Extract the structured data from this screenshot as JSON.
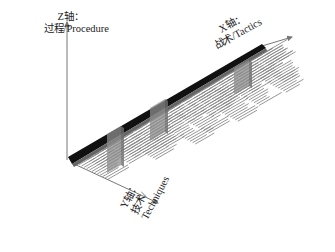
{
  "diagram": {
    "title": "",
    "axes": {
      "z": {
        "line1": "Z轴：",
        "line2": "过程/Procedure"
      },
      "x": {
        "line1": "X轴：",
        "line2": "战术/Tactics"
      },
      "y": {
        "line1": "Y轴：",
        "line2": "技术/",
        "line3": "Techniques"
      }
    },
    "colors": {
      "axis": "#777777",
      "tactic_bar": "#111111",
      "technique_lines": "#8a8a8a",
      "pillar": "#8c8c8c"
    },
    "pillars": [
      {
        "name": "procedure-pillar-1"
      },
      {
        "name": "procedure-pillar-2"
      },
      {
        "name": "procedure-pillar-3"
      }
    ]
  }
}
